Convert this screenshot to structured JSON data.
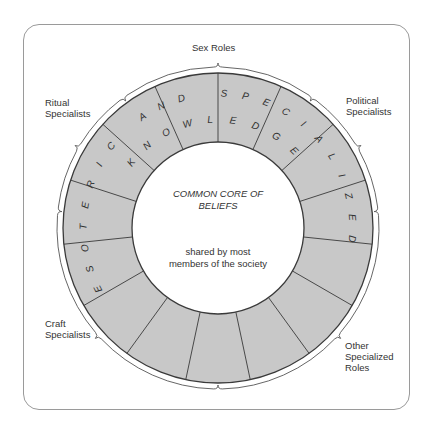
{
  "diagram": {
    "center_title_line1": "COMMON CORE OF",
    "center_title_line2": "BELIEFS",
    "center_subtitle_line1": "shared by most",
    "center_subtitle_line2": "members of the society",
    "ring_text_outer": "ESOTERIC AND SPECIALIZED",
    "ring_text_inner": "KNOWLEDGE",
    "segments_count": 15,
    "ring_fill": "#c8c8c8",
    "line_color": "#3a3a3a",
    "roles": [
      {
        "id": "sex-roles",
        "line1": "Sex Roles",
        "line2": ""
      },
      {
        "id": "political-specialists",
        "line1": "Political",
        "line2": "Specialists"
      },
      {
        "id": "other-specialized-roles",
        "line1": "Other",
        "line2": "Specialized",
        "line3": "Roles"
      },
      {
        "id": "craft-specialists",
        "line1": "Craft",
        "line2": "Specialists"
      },
      {
        "id": "ritual-specialists",
        "line1": "Ritual",
        "line2": "Specialists"
      }
    ]
  }
}
